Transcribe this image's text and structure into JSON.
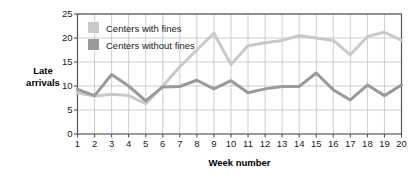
{
  "chart_data": {
    "type": "line",
    "title": "",
    "xlabel": "Week number",
    "ylabel": "Late arrivals",
    "ylabel_line1": "Late",
    "ylabel_line2": "arrivals",
    "grid": true,
    "legend_position": "top-left-inside",
    "xlim": [
      1,
      20
    ],
    "ylim": [
      0,
      25
    ],
    "ytick_step": 5,
    "x": [
      1,
      2,
      3,
      4,
      5,
      6,
      7,
      8,
      9,
      10,
      11,
      12,
      13,
      14,
      15,
      16,
      17,
      18,
      19,
      20
    ],
    "xticklabels": [
      "1",
      "2",
      "3",
      "4",
      "5",
      "6",
      "7",
      "8",
      "9",
      "10",
      "11",
      "12",
      "13",
      "14",
      "15",
      "16",
      "17",
      "18",
      "19",
      "20"
    ],
    "yticklabels": [
      "0",
      "5",
      "10",
      "15",
      "20",
      "25"
    ],
    "yticks": [
      0,
      5,
      10,
      15,
      20,
      25
    ],
    "series": [
      {
        "name": "Centers with fines",
        "color": "#c9c9c9",
        "values": [
          8.6,
          7.9,
          8.3,
          8.0,
          6.3,
          10.0,
          14.0,
          17.5,
          21.0,
          14.5,
          18.4,
          19.0,
          19.5,
          20.5,
          20.0,
          19.5,
          16.5,
          20.3,
          21.2,
          19.5
        ]
      },
      {
        "name": "Centers without fines",
        "color": "#9a9a9a",
        "values": [
          9.3,
          8.0,
          12.4,
          10.0,
          6.9,
          9.8,
          9.9,
          11.2,
          9.4,
          11.1,
          8.6,
          9.4,
          9.9,
          9.9,
          12.7,
          9.2,
          7.1,
          10.2,
          8.0,
          10.2
        ]
      }
    ]
  },
  "legend": {
    "items": [
      {
        "label": "Centers with fines",
        "color": "#c9c9c9"
      },
      {
        "label": "Centers without fines",
        "color": "#9a9a9a"
      }
    ]
  },
  "colors": {
    "with_fines": "#c9c9c9",
    "without_fines": "#9a9a9a",
    "grid": "#b9b9c4",
    "axis": "#55555f",
    "text": "#1a1a1a"
  }
}
